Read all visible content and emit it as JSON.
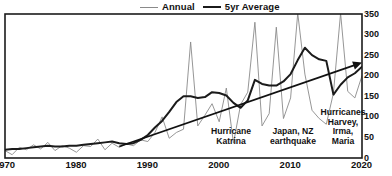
{
  "legend": {
    "position": "top-center",
    "items": [
      {
        "label": "Annual",
        "swatch": "thin-gray-line",
        "color": "#8a8a8a"
      },
      {
        "label": "5yr Average",
        "swatch": "thick-black-line",
        "color": "#1b1b1b"
      }
    ]
  },
  "axes": {
    "y": {
      "side": "right",
      "ticks": [
        "350",
        "300",
        "250",
        "200",
        "150",
        "100",
        "50",
        "0"
      ]
    },
    "x": {
      "ticks": [
        "1970",
        "1980",
        "1990",
        "2000",
        "2010",
        "2020"
      ]
    }
  },
  "annotations": [
    {
      "text": "Hurricane\nKatrina",
      "year": 2005
    },
    {
      "text": "Japan, NZ\nearthquake",
      "year": 2011
    },
    {
      "text": "Hurricanes\nHarvey,\nIrma,\nMaria",
      "year": 2017
    }
  ],
  "chart_data": {
    "type": "line",
    "title": "",
    "xlabel": "",
    "ylabel": "",
    "xlim": [
      1970,
      2020
    ],
    "ylim": [
      0,
      350
    ],
    "grid": false,
    "legend_position": "top-center",
    "x": [
      1970,
      1971,
      1972,
      1973,
      1974,
      1975,
      1976,
      1977,
      1978,
      1979,
      1980,
      1981,
      1982,
      1983,
      1984,
      1985,
      1986,
      1987,
      1988,
      1989,
      1990,
      1991,
      1992,
      1993,
      1994,
      1995,
      1996,
      1997,
      1998,
      1999,
      2000,
      2001,
      2002,
      2003,
      2004,
      2005,
      2006,
      2007,
      2008,
      2009,
      2010,
      2011,
      2012,
      2013,
      2014,
      2015,
      2016,
      2017,
      2018,
      2019,
      2020
    ],
    "series": [
      {
        "name": "Annual",
        "color": "#8a8a8a",
        "style": "thin",
        "values": [
          18,
          8,
          26,
          20,
          32,
          22,
          38,
          18,
          30,
          24,
          14,
          30,
          28,
          46,
          20,
          36,
          26,
          34,
          30,
          44,
          40,
          62,
          100,
          48,
          62,
          70,
          282,
          78,
          104,
          132,
          88,
          170,
          36,
          130,
          160,
          330,
          78,
          108,
          318,
          96,
          146,
          352,
          204,
          116,
          96,
          82,
          158,
          352,
          162,
          146,
          200
        ]
      },
      {
        "name": "5yr Average",
        "color": "#1b1b1b",
        "style": "thick",
        "values": [
          20,
          22,
          22,
          24,
          26,
          28,
          30,
          28,
          28,
          30,
          30,
          32,
          34,
          36,
          38,
          40,
          36,
          34,
          36,
          44,
          56,
          74,
          90,
          112,
          136,
          150,
          150,
          146,
          148,
          160,
          158,
          152,
          134,
          122,
          140,
          190,
          180,
          176,
          176,
          186,
          204,
          238,
          268,
          250,
          240,
          236,
          154,
          178,
          196,
          206,
          222
        ]
      },
      {
        "name": "Trend",
        "color": "#111111",
        "style": "arrow",
        "points": [
          [
            1986,
            28
          ],
          [
            2020,
            232
          ]
        ]
      }
    ]
  }
}
